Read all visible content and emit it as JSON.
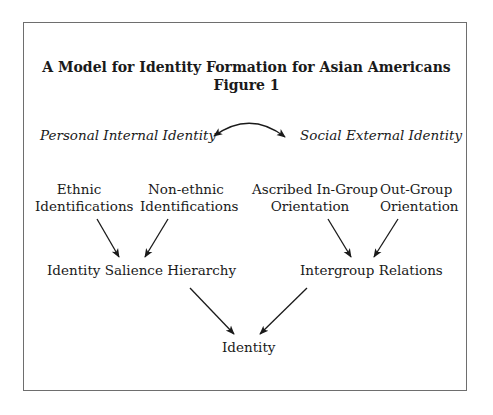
{
  "figure": {
    "title": "A Model for Identity Formation for Asian Americans",
    "subtitle": "Figure 1",
    "top_labels": {
      "left": "Personal Internal Identity",
      "right": "Social External Identity"
    },
    "sources": {
      "ethnic": [
        "Ethnic",
        "Identifications"
      ],
      "nonethnic": [
        "Non-ethnic",
        "Identifications"
      ],
      "ascribed": [
        "Ascribed In-Group",
        "Orientation"
      ],
      "outgroup": [
        "Out-Group",
        "Orientation"
      ]
    },
    "intermediate": {
      "salience": "Identity Salience Hierarchy",
      "intergroup": "Intergroup Relations"
    },
    "outcome": "Identity",
    "edges": [
      {
        "from": "Personal Internal Identity",
        "to": "Social External Identity",
        "type": "bidirectional-curved"
      },
      {
        "from": "Ethnic Identifications",
        "to": "Identity Salience Hierarchy"
      },
      {
        "from": "Non-ethnic Identifications",
        "to": "Identity Salience Hierarchy"
      },
      {
        "from": "Ascribed In-Group Orientation",
        "to": "Intergroup Relations"
      },
      {
        "from": "Out-Group Orientation",
        "to": "Intergroup Relations"
      },
      {
        "from": "Identity Salience Hierarchy",
        "to": "Identity"
      },
      {
        "from": "Intergroup Relations",
        "to": "Identity"
      }
    ]
  }
}
